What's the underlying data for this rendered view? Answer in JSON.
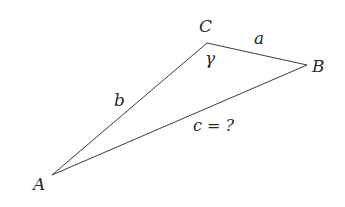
{
  "diagram": {
    "type": "triangle",
    "vertices": [
      {
        "name": "A",
        "label": "A",
        "x": 52,
        "y": 175
      },
      {
        "name": "B",
        "label": "B",
        "x": 307,
        "y": 65
      },
      {
        "name": "C",
        "label": "C",
        "x": 207,
        "y": 43
      }
    ],
    "sides": [
      {
        "name": "a",
        "label": "a",
        "from": "C",
        "to": "B"
      },
      {
        "name": "b",
        "label": "b",
        "from": "A",
        "to": "C"
      },
      {
        "name": "c",
        "label": "c = ?",
        "from": "A",
        "to": "B"
      }
    ],
    "angles": [
      {
        "name": "gamma",
        "label": "γ",
        "at": "C"
      }
    ],
    "colors": {
      "line": "#3a3a3a",
      "text": "#2a2a2a",
      "background": "#ffffff"
    }
  }
}
